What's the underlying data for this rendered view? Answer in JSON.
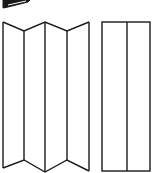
{
  "figure": {
    "stroke_color": "#1a1a1a",
    "background": "#ffffff",
    "folded_screen": {
      "top": [
        [
          3,
          22
        ],
        [
          24,
          31
        ],
        [
          45,
          22
        ],
        [
          67,
          31
        ],
        [
          89,
          22
        ]
      ],
      "bottom": [
        [
          3,
          168
        ],
        [
          24,
          160
        ],
        [
          45,
          172
        ],
        [
          67,
          160
        ],
        [
          89,
          171
        ]
      ],
      "panels": 4
    },
    "flat_screen": {
      "x": 102,
      "y": 22,
      "width": 48,
      "height": 149,
      "divider_x": 127,
      "panels": 2
    },
    "corner_icon": "pen-wedge-icon"
  }
}
